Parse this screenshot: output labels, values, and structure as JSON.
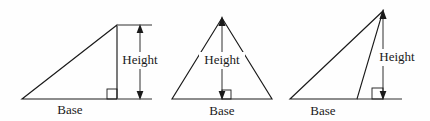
{
  "figure": {
    "background_color": "#fefefe",
    "ink_color": "#1a1a1a",
    "label_font_size_px": 13,
    "panel_count": 3
  },
  "panels": [
    {
      "id": "right-triangle",
      "name": "right-triangle-panel",
      "description": "Right triangle with vertical height on the right side",
      "base_label": "Base",
      "height_label": "Height",
      "has_right_angle_marker": true,
      "height_is_inside": false,
      "triangle_points": "22,99 117,99 117,25",
      "base_segment": {
        "x1": 22,
        "y1": 99,
        "x2": 117,
        "y2": 99
      },
      "height_arrow": {
        "x": 140,
        "y_top": 26,
        "y_bottom": 99,
        "double_headed": true
      },
      "right_angle_marker": {
        "x": 107,
        "y": 89,
        "size": 10
      },
      "extension_ticks": [
        {
          "x1": 118,
          "y1": 25,
          "x2": 152,
          "y2": 25
        },
        {
          "x1": 118,
          "y1": 99,
          "x2": 152,
          "y2": 99
        }
      ],
      "base_label_pos": {
        "x": 70,
        "y": 110
      },
      "height_label_pos": {
        "x": 140,
        "y": 60
      }
    },
    {
      "id": "acute-triangle",
      "name": "acute-triangle-panel",
      "description": "Acute isosceles triangle with height drawn inside from apex to base",
      "base_label": "Base",
      "height_label": "Height",
      "has_right_angle_marker": true,
      "height_is_inside": true,
      "triangle_points": "172,99 272,99 222,18",
      "base_segment": {
        "x1": 172,
        "y1": 99,
        "x2": 272,
        "y2": 99
      },
      "height_arrow": {
        "x": 222,
        "y_top": 19,
        "y_bottom": 98,
        "double_headed": true
      },
      "right_angle_marker": {
        "x": 222,
        "y": 90,
        "size": 9
      },
      "extension_ticks": [],
      "base_label_pos": {
        "x": 222,
        "y": 111
      },
      "height_label_pos": {
        "x": 222,
        "y": 60
      }
    },
    {
      "id": "obtuse-triangle",
      "name": "obtuse-triangle-panel",
      "description": "Obtuse triangle with height falling outside the base, base extended",
      "base_label": "Base",
      "height_label": "Height",
      "has_right_angle_marker": true,
      "height_is_inside": false,
      "triangle_points": "290,99 357,99 383,11",
      "base_segment": {
        "x1": 290,
        "y1": 99,
        "x2": 357,
        "y2": 99
      },
      "base_extension": {
        "x1": 357,
        "y1": 99,
        "x2": 402,
        "y2": 99
      },
      "height_arrow": {
        "x": 383,
        "y_top": 12,
        "y_bottom": 98,
        "double_headed": true
      },
      "right_angle_marker": {
        "x": 372,
        "y": 88,
        "size": 11
      },
      "extension_ticks": [],
      "base_label_pos": {
        "x": 323,
        "y": 111
      },
      "height_label_pos": {
        "x": 397,
        "y": 57
      }
    }
  ]
}
